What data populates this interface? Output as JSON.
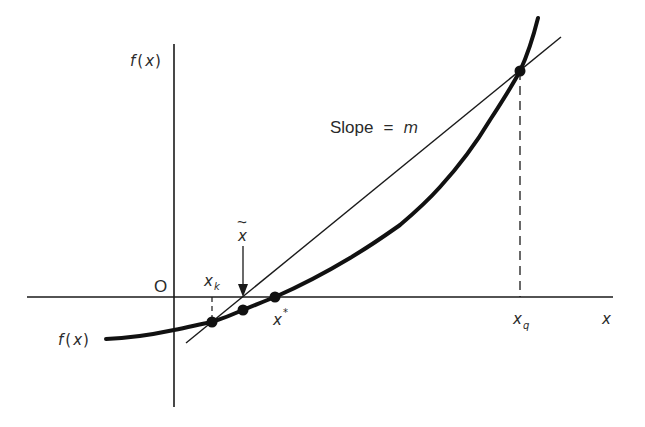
{
  "figure": {
    "labels": {
      "y_axis": "f(x)",
      "y_axis_parts": [
        "f",
        "(",
        "x",
        ")"
      ],
      "x_axis": "x",
      "origin": "O",
      "curve": "f(x)",
      "curve_parts": [
        "f",
        "(",
        "x",
        ")"
      ],
      "slope_text": "Slope",
      "slope_equals": "=",
      "slope_symbol": "m",
      "xk_main": "x",
      "xk_sub": "k",
      "xq_main": "x",
      "xq_sub": "q",
      "xstar_main": "x",
      "xstar_sup": "*",
      "xtilde_main": "x",
      "xtilde_accent": "~"
    },
    "points": [
      {
        "name": "x_k",
        "description": "point on curve at x_k"
      },
      {
        "name": "x_tilde",
        "description": "point on curve at x-tilde (secant root)"
      },
      {
        "name": "x_star",
        "description": "true root of f(x)"
      },
      {
        "name": "x_q",
        "description": "point on curve at x_q"
      }
    ],
    "colors": {
      "ink": "#1a1a1a",
      "background": "#ffffff"
    }
  }
}
